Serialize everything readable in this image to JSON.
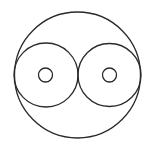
{
  "canvas": {
    "width": 154,
    "height": 157,
    "background": "#ffffff"
  },
  "stroke": {
    "color": "#2a2a2a",
    "width": 1.3
  },
  "shapes": {
    "outer_circle": {
      "cx": 77.5,
      "cy": 75,
      "r": 63
    },
    "left_inner_circle": {
      "cx": 46,
      "cy": 75,
      "r": 32
    },
    "right_inner_circle": {
      "cx": 109.5,
      "cy": 75,
      "r": 31.5
    },
    "left_small_circle": {
      "cx": 45.5,
      "cy": 75,
      "r": 7
    },
    "right_small_circle": {
      "cx": 109.5,
      "cy": 75,
      "r": 7
    }
  }
}
